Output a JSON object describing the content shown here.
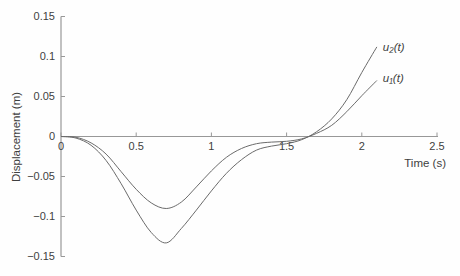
{
  "figure": {
    "background": "#fefefe",
    "axis_color": "#989898",
    "curve_color": "#6b6b6b",
    "text_color": "#3f3f3f"
  },
  "chart_data": {
    "type": "line",
    "title": "",
    "xlabel": "Time (s)",
    "ylabel": "Displacement (m)",
    "xlim": [
      0,
      2.5
    ],
    "ylim": [
      -0.15,
      0.15
    ],
    "grid": false,
    "legend_position": "inline-annotations",
    "x_ticks": {
      "values": [
        0,
        0.5,
        1,
        1.5,
        2,
        2.5
      ],
      "labels": [
        "0",
        "0.5",
        "1",
        "1.5",
        "2",
        "2.5"
      ]
    },
    "y_ticks": {
      "values": [
        0.15,
        0.1,
        0.05,
        0,
        -0.05,
        -0.1,
        -0.15
      ],
      "labels": [
        "0.15",
        "0.1",
        "0.05",
        "0",
        "−0.05",
        "−0.1",
        "−0.15"
      ]
    },
    "x": [
      0,
      0.1,
      0.2,
      0.3,
      0.4,
      0.5,
      0.6,
      0.7,
      0.8,
      0.9,
      1.0,
      1.1,
      1.2,
      1.3,
      1.4,
      1.5,
      1.6,
      1.7,
      1.8,
      1.9,
      2.0,
      2.1
    ],
    "series": [
      {
        "id": "u1",
        "name": "u₁(t)",
        "values": [
          0,
          -0.001,
          -0.008,
          -0.022,
          -0.044,
          -0.066,
          -0.083,
          -0.09,
          -0.082,
          -0.063,
          -0.043,
          -0.026,
          -0.015,
          -0.009,
          -0.007,
          -0.006,
          -0.003,
          0.004,
          0.014,
          0.031,
          0.051,
          0.07
        ],
        "min": {
          "t": 0.7,
          "u": -0.09
        },
        "end": {
          "t": 2.1,
          "u": 0.07
        }
      },
      {
        "id": "u2",
        "name": "u₂(t)",
        "values": [
          0,
          -0.002,
          -0.011,
          -0.03,
          -0.059,
          -0.092,
          -0.12,
          -0.133,
          -0.115,
          -0.092,
          -0.068,
          -0.046,
          -0.029,
          -0.017,
          -0.012,
          -0.009,
          -0.004,
          0.006,
          0.022,
          0.046,
          0.08,
          0.112
        ],
        "min": {
          "t": 0.7,
          "u": -0.133
        },
        "end": {
          "t": 2.1,
          "u": 0.112
        }
      }
    ],
    "annotations": [
      {
        "id": "u2",
        "text": "u₂(t)",
        "x": 2.14,
        "y": 0.107
      },
      {
        "id": "u1",
        "text": "u₁(t)",
        "x": 2.14,
        "y": 0.068
      }
    ]
  }
}
